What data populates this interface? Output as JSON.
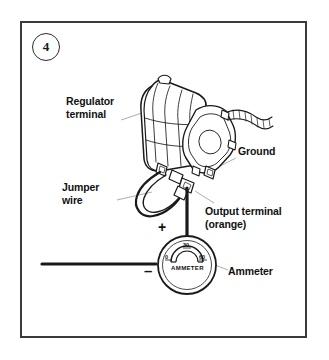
{
  "figure": {
    "number": "4"
  },
  "labels": {
    "regulator_terminal": "Regulator\nterminal",
    "jumper_wire": "Jumper\nwire",
    "ground": "Ground",
    "output_terminal": "Output terminal\n(orange)",
    "ammeter": "Ammeter"
  },
  "polarity": {
    "positive": "+",
    "negative": "–"
  },
  "ammeter_gauge": {
    "face_text": "AMMETER",
    "scale_ticks": [
      "0",
      "30",
      "60"
    ]
  },
  "colors": {
    "ink": "#111111",
    "frame": "#3a3a3a",
    "background": "#ffffff"
  },
  "icons": {
    "alternator": "alternator-illustration",
    "jumper_loop": "jumper-wire-loop",
    "harness": "wire-harness"
  }
}
